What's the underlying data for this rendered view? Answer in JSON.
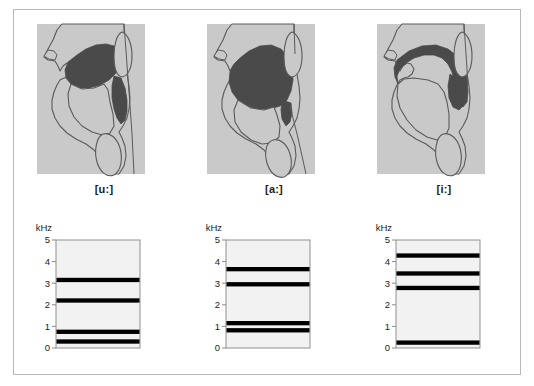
{
  "figure": {
    "title": "",
    "colors": {
      "tissue_fill": "#c9c9c9",
      "cavity_fill": "#4a4a4a",
      "outline": "#5a5a5a",
      "plot_background": "#f2f2f2",
      "plot_border": "#8f8f8f",
      "band_color": "#000000",
      "frame_border": "#b9b9b9"
    }
  },
  "panels": [
    {
      "id": "u",
      "vowel_label": "[u:]",
      "diagram_name": "sagittal-vocal-tract-u"
    },
    {
      "id": "a",
      "vowel_label": "[a:]",
      "diagram_name": "sagittal-vocal-tract-a"
    },
    {
      "id": "i",
      "vowel_label": "[i:]",
      "diagram_name": "sagittal-vocal-tract-i"
    }
  ],
  "chart_data": [
    {
      "type": "bar",
      "id": "spectrum-u",
      "title": "[u:]",
      "xlabel": "",
      "ylabel": "kHz",
      "ylim": [
        0,
        5
      ],
      "yticks": [
        0,
        1,
        2,
        3,
        4,
        5
      ],
      "ytick_labels": [
        "0",
        "1",
        "2",
        "3",
        "4",
        "5"
      ],
      "grid": false,
      "legend": "none",
      "orientation": "horizontal",
      "categories": [
        "F1",
        "F2",
        "F3",
        "F4"
      ],
      "values": [
        0.3,
        0.75,
        2.2,
        3.15
      ],
      "band_thickness_khz": 0.2,
      "annotation": "Formant bands for close back rounded vowel [u:]"
    },
    {
      "type": "bar",
      "id": "spectrum-a",
      "title": "[a:]",
      "xlabel": "",
      "ylabel": "kHz",
      "ylim": [
        0,
        5
      ],
      "yticks": [
        0,
        1,
        2,
        3,
        4,
        5
      ],
      "ytick_labels": [
        "0",
        "1",
        "2",
        "3",
        "4",
        "5"
      ],
      "grid": false,
      "legend": "none",
      "orientation": "horizontal",
      "categories": [
        "F1",
        "F2",
        "F3",
        "F4"
      ],
      "values": [
        0.82,
        1.15,
        2.95,
        3.65
      ],
      "band_thickness_khz": 0.2,
      "annotation": "Formant bands for open front unrounded vowel [a:]"
    },
    {
      "type": "bar",
      "id": "spectrum-i",
      "title": "[i:]",
      "xlabel": "",
      "ylabel": "kHz",
      "ylim": [
        0,
        5
      ],
      "yticks": [
        0,
        1,
        2,
        3,
        4,
        5
      ],
      "ytick_labels": [
        "0",
        "1",
        "2",
        "3",
        "4",
        "5"
      ],
      "grid": false,
      "legend": "none",
      "orientation": "horizontal",
      "categories": [
        "F1",
        "F2",
        "F3",
        "F4"
      ],
      "values": [
        0.25,
        2.78,
        3.45,
        4.28
      ],
      "band_thickness_khz": 0.2,
      "annotation": "Formant bands for close front unrounded vowel [i:]"
    }
  ]
}
